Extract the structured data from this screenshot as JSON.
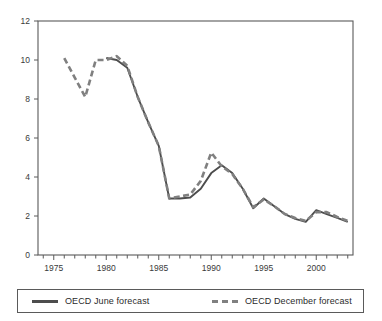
{
  "chart_data": {
    "type": "line",
    "title": "",
    "subtitle": "",
    "xlabel": "",
    "ylabel": "",
    "xlim": [
      1973.5,
      2003.5
    ],
    "ylim": [
      0,
      12
    ],
    "grid": false,
    "legend_position": "bottom",
    "x_ticks_major": [
      1975,
      1980,
      1985,
      1990,
      1995,
      2000
    ],
    "x_tick_labels": [
      "1975",
      "1980",
      "1985",
      "1990",
      "1995",
      "2000"
    ],
    "x_minor_tick_interval": 1,
    "y_ticks": [
      0,
      2,
      4,
      6,
      8,
      10,
      12
    ],
    "y_tick_labels": [
      "0",
      "2",
      "4",
      "6",
      "8",
      "10",
      "12"
    ],
    "series": [
      {
        "name": "OECD June forecast",
        "style": "solid",
        "color": "#4d4d4d",
        "x": [
          1980,
          1981,
          1982,
          1983,
          1984,
          1985,
          1986,
          1987,
          1988,
          1989,
          1990,
          1991,
          1992,
          1993,
          1994,
          1995,
          1996,
          1997,
          1998,
          1999,
          2000,
          2001,
          2002,
          2003
        ],
        "values": [
          10.1,
          10.0,
          9.6,
          8.1,
          6.8,
          5.6,
          2.9,
          2.9,
          2.95,
          3.4,
          4.2,
          4.6,
          4.2,
          3.4,
          2.4,
          2.9,
          2.5,
          2.1,
          1.85,
          1.7,
          2.3,
          2.1,
          1.9,
          1.7
        ]
      },
      {
        "name": "OECD December forecast",
        "style": "dashed",
        "color": "#808080",
        "x": [
          1976,
          1977,
          1978,
          1979,
          1980,
          1981,
          1982,
          1983,
          1984,
          1985,
          1986,
          1987,
          1988,
          1989,
          1990,
          1991,
          1992,
          1993,
          1994,
          1995,
          1996,
          1997,
          1998,
          1999,
          2000,
          2001,
          2002,
          2003
        ],
        "values": [
          10.1,
          9.1,
          8.1,
          10.0,
          10.0,
          10.2,
          9.7,
          8.1,
          6.8,
          5.6,
          2.9,
          3.0,
          3.1,
          3.8,
          5.25,
          4.55,
          4.15,
          3.4,
          2.45,
          2.85,
          2.5,
          2.1,
          1.9,
          1.75,
          2.2,
          2.2,
          1.95,
          1.75
        ]
      }
    ]
  },
  "legend": {
    "entries": [
      {
        "label": "OECD June forecast",
        "style": "solid"
      },
      {
        "label": "OECD December forecast",
        "style": "dashed"
      }
    ]
  },
  "colors": {
    "june_line": "#4d4d4d",
    "december_line": "#808080",
    "axis": "#5a5a5a",
    "text": "#3a3a3a",
    "background": "#ffffff"
  }
}
